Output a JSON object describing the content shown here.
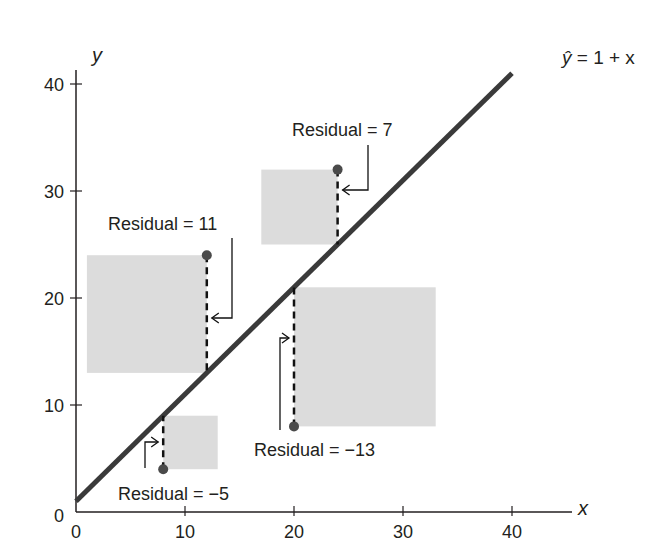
{
  "chart_data": {
    "type": "scatter",
    "title": "",
    "xlabel": "x",
    "ylabel": "y",
    "xlim": [
      0,
      42
    ],
    "ylim": [
      0,
      42
    ],
    "x_ticks": [
      0,
      10,
      20,
      30,
      40
    ],
    "y_ticks": [
      0,
      10,
      20,
      30,
      40
    ],
    "grid": false,
    "regression_line": {
      "label": "ŷ = 1 + x",
      "label_hat": "ŷ",
      "label_rest": " = 1 + x",
      "intercept": 1,
      "slope": 1,
      "x_range": [
        0,
        40
      ]
    },
    "points": [
      {
        "x": 8,
        "y": 4,
        "predicted": 9,
        "residual": -5,
        "label": "Residual = −5"
      },
      {
        "x": 12,
        "y": 24,
        "predicted": 13,
        "residual": 11,
        "label": "Residual = 11"
      },
      {
        "x": 24,
        "y": 32,
        "predicted": 25,
        "residual": 7,
        "label": "Residual = 7"
      },
      {
        "x": 20,
        "y": 8,
        "predicted": 21,
        "residual": -13,
        "label": "Residual = −13"
      }
    ],
    "annotation": "Squared residuals shown as shaded squares with side length |residual|"
  },
  "colors": {
    "line": "#3a3a3a",
    "square": "#dcdcdc",
    "point": "#4a4a4a",
    "axis": "#231f20"
  }
}
